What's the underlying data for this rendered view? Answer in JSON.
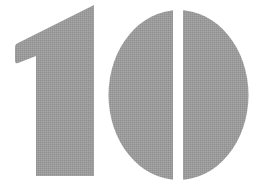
{
  "graphic": {
    "text": "10",
    "fill_color": "#9a9a9a",
    "background_color": "#ffffff"
  }
}
